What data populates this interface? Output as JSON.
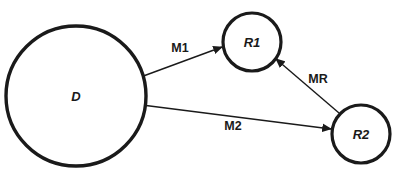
{
  "diagram": {
    "type": "node-link-diagram",
    "background_color": "#ffffff",
    "stroke_color": "#1a1a1a",
    "nodes": [
      {
        "id": "D",
        "label": "D",
        "shape": "circle",
        "cx": 76,
        "cy": 96,
        "r": 70,
        "stroke_width": 3.4,
        "label_style": "bold-italic",
        "label_font_size": 13
      },
      {
        "id": "R1",
        "label": "R1",
        "shape": "circle",
        "cx": 252,
        "cy": 42,
        "r": 29,
        "stroke_width": 3.2,
        "label_style": "bold-italic",
        "label_font_size": 13
      },
      {
        "id": "R2",
        "label": "R2",
        "shape": "circle",
        "cx": 361,
        "cy": 134,
        "r": 29,
        "stroke_width": 3.2,
        "label_style": "bold-italic",
        "label_font_size": 13
      }
    ],
    "edges": [
      {
        "id": "M1",
        "label": "M1",
        "from": "D",
        "to": "R1",
        "x1": 138,
        "y1": 78,
        "x2": 222,
        "y2": 47,
        "arrowhead": "end",
        "stroke_width": 1.4,
        "label_x": 180,
        "label_y": 48,
        "label_style": "bold",
        "label_font_size": 12.5
      },
      {
        "id": "M2",
        "label": "M2",
        "from": "D",
        "to": "R2",
        "x1": 142,
        "y1": 105,
        "x2": 331,
        "y2": 129,
        "arrowhead": "end",
        "stroke_width": 1.4,
        "label_x": 233,
        "label_y": 126,
        "label_style": "bold",
        "label_font_size": 12.5
      },
      {
        "id": "MR",
        "label": "MR",
        "from": "R2",
        "to": "R1",
        "x1": 339,
        "y1": 113,
        "x2": 276,
        "y2": 59,
        "arrowhead": "end",
        "stroke_width": 1.4,
        "label_x": 318,
        "label_y": 79,
        "label_style": "bold",
        "label_font_size": 12.5
      }
    ]
  }
}
